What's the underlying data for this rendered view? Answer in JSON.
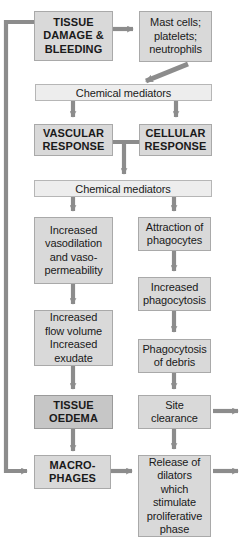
{
  "diagram": {
    "colors": {
      "box_fill": "#d9d9d9",
      "box_fill_dark": "#c6c6c6",
      "bar_fill": "#ededed",
      "box_border": "#a9a9a9",
      "arrow": "#8c8c8c",
      "text": "#1a1a1a",
      "background": "#ffffff"
    },
    "nodes": [
      {
        "id": "tissue_damage",
        "label": "TISSUE\nDAMAGE &\nBLEEDING"
      },
      {
        "id": "mast_cells",
        "label": "Mast cells;\nplatelets;\nneutrophils"
      },
      {
        "id": "chem_mediators_1",
        "label": "Chemical mediators"
      },
      {
        "id": "vascular_response",
        "label": "VASCULAR\nRESPONSE"
      },
      {
        "id": "cellular_response",
        "label": "CELLULAR\nRESPONSE"
      },
      {
        "id": "chem_mediators_2",
        "label": "Chemical mediators"
      },
      {
        "id": "vasodilation",
        "label": "Increased\nvasodilation\nand vaso-\npermeability"
      },
      {
        "id": "attraction",
        "label": "Attraction of\nphagocytes"
      },
      {
        "id": "flow_volume",
        "label": "Increased\nflow volume\nIncreased\nexudate"
      },
      {
        "id": "increased_phago",
        "label": "Increased\nphagocytosis"
      },
      {
        "id": "phago_debris",
        "label": "Phagocytosis\nof debris"
      },
      {
        "id": "tissue_oedema",
        "label": "TISSUE\nOEDEMA"
      },
      {
        "id": "site_clearance",
        "label": "Site\nclearance"
      },
      {
        "id": "macrophages",
        "label": "MACRO-\nPHAGES"
      },
      {
        "id": "release_dilators",
        "label": "Release of\ndilators\nwhich\nstimulate\nproliferative\nphase"
      }
    ],
    "edges": [
      {
        "from": "tissue_damage",
        "to": "mast_cells",
        "kind": "arrow-right"
      },
      {
        "from": "mast_cells",
        "to": "chem_mediators_1",
        "kind": "arrow-diagonal"
      },
      {
        "from": "chem_mediators_1",
        "to": "vascular_response",
        "kind": "arrow-down"
      },
      {
        "from": "chem_mediators_1",
        "to": "cellular_response",
        "kind": "arrow-down"
      },
      {
        "from": "vascular_response",
        "to": "chem_mediators_2",
        "kind": "arrow-down-join"
      },
      {
        "from": "cellular_response",
        "to": "chem_mediators_2",
        "kind": "arrow-down-join"
      },
      {
        "from": "chem_mediators_2",
        "to": "vasodilation",
        "kind": "arrow-down"
      },
      {
        "from": "chem_mediators_2",
        "to": "attraction",
        "kind": "arrow-down"
      },
      {
        "from": "vasodilation",
        "to": "flow_volume",
        "kind": "arrow-down"
      },
      {
        "from": "attraction",
        "to": "increased_phago",
        "kind": "arrow-down"
      },
      {
        "from": "increased_phago",
        "to": "phago_debris",
        "kind": "arrow-down"
      },
      {
        "from": "flow_volume",
        "to": "tissue_oedema",
        "kind": "arrow-down"
      },
      {
        "from": "phago_debris",
        "to": "site_clearance",
        "kind": "arrow-down"
      },
      {
        "from": "tissue_oedema",
        "to": "macrophages",
        "kind": "arrow-down"
      },
      {
        "from": "site_clearance",
        "to": "release_dilators",
        "kind": "arrow-down"
      },
      {
        "from": "macrophages",
        "to": "release_dilators",
        "kind": "arrow-right"
      },
      {
        "from": "tissue_damage",
        "to": "macrophages",
        "kind": "feedback-loop-left"
      },
      {
        "from": "site_clearance",
        "to": "exit",
        "kind": "arrow-right-exit"
      },
      {
        "from": "release_dilators",
        "to": "exit",
        "kind": "arrow-right-exit"
      }
    ]
  }
}
